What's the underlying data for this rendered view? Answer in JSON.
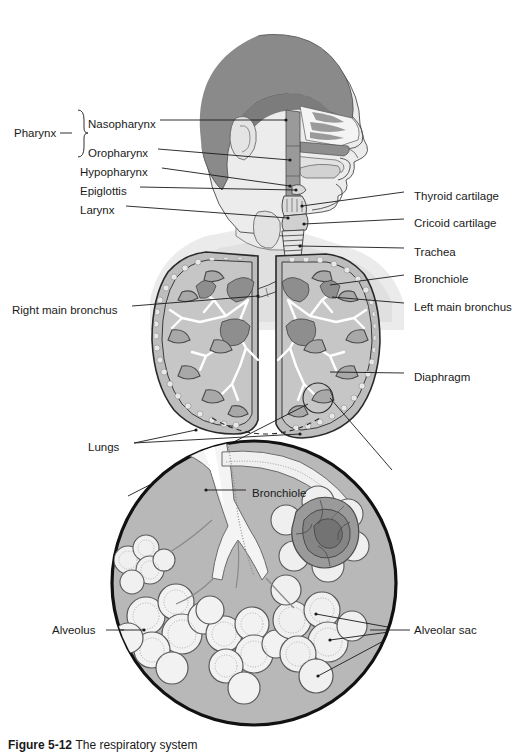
{
  "figure": {
    "caption_label": "Figure 5-12",
    "caption_text": "The respiratory system"
  },
  "labels_left": [
    {
      "id": "pharynx",
      "text": "Pharynx",
      "x": 14,
      "y": 133
    },
    {
      "id": "nasopharynx",
      "text": "Nasopharynx",
      "x": 88,
      "y": 124
    },
    {
      "id": "oropharynx",
      "text": "Oropharynx",
      "x": 88,
      "y": 153
    },
    {
      "id": "hypopharynx",
      "text": "Hypopharynx",
      "x": 80,
      "y": 172
    },
    {
      "id": "epiglottis",
      "text": "Epiglottis",
      "x": 80,
      "y": 191
    },
    {
      "id": "larynx",
      "text": "Larynx",
      "x": 80,
      "y": 210
    },
    {
      "id": "right-main-bronchus",
      "text": "Right main bronchus",
      "x": 12,
      "y": 310
    },
    {
      "id": "lungs",
      "text": "Lungs",
      "x": 88,
      "y": 447
    },
    {
      "id": "alveolus",
      "text": "Alveolus",
      "x": 52,
      "y": 630
    }
  ],
  "labels_right": [
    {
      "id": "thyroid-cartilage",
      "text": "Thyroid cartilage",
      "x": 414,
      "y": 196
    },
    {
      "id": "cricoid-cartilage",
      "text": "Cricoid cartilage",
      "x": 414,
      "y": 223
    },
    {
      "id": "trachea",
      "text": "Trachea",
      "x": 414,
      "y": 252
    },
    {
      "id": "bronchiole",
      "text": "Bronchiole",
      "x": 414,
      "y": 279
    },
    {
      "id": "left-main-bronchus",
      "text": "Left main bronchus",
      "x": 414,
      "y": 307
    },
    {
      "id": "diaphragm",
      "text": "Diaphragm",
      "x": 414,
      "y": 377
    },
    {
      "id": "alveolar-sac",
      "text": "Alveolar sac",
      "x": 414,
      "y": 630
    }
  ],
  "labels_inset": [
    {
      "id": "inset-bronchiole",
      "text": "Bronchiole",
      "x": 252,
      "y": 493
    }
  ],
  "colors": {
    "line": "#1a1a1a",
    "hair": "#8a8a8a",
    "skin": "#e8e8e8",
    "skin_shadow": "#d5d5d5",
    "mucosa": "#9a9a9a",
    "lung_fill": "#b4b4b4",
    "lung_dark": "#8e8e8e",
    "inset_bg": "#b8b8b8",
    "airway_light": "#f2f2f2",
    "capillary": "#7f7f7f",
    "capillary_dark": "#6a6a6a",
    "background": "#ffffff"
  }
}
